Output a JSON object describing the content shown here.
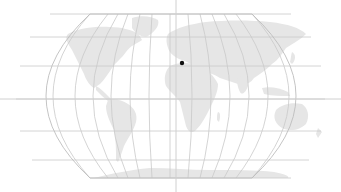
{
  "map": {
    "projection": "robinson",
    "background_color": "#ffffff",
    "land_color": "#e6e6e6",
    "graticule_color": "#c9c9c9",
    "crosshair_color": "#d0d0d0",
    "marker_color": "#111111",
    "crosshair": {
      "x": 176,
      "y": 99
    },
    "marker": {
      "x": 182,
      "y": 63,
      "label": ""
    }
  }
}
